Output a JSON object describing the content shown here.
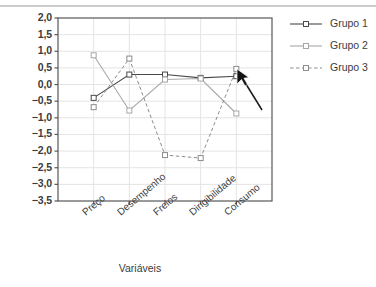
{
  "chart_data": {
    "type": "line",
    "title": "",
    "xlabel": "Variáveis",
    "ylabel": "",
    "categories": [
      "Preço",
      "Desempenho",
      "Freios",
      "Dirigibilidade",
      "Consumo"
    ],
    "series": [
      {
        "name": "Grupo 1",
        "values": [
          -0.4,
          0.3,
          0.3,
          0.2,
          0.25
        ],
        "color": "#4a4a4a",
        "dash": "solid",
        "marker": "open-square"
      },
      {
        "name": "Grupo 2",
        "values": [
          0.88,
          -0.78,
          0.15,
          0.18,
          -0.87
        ],
        "color": "#a8a8a8",
        "dash": "solid",
        "marker": "open-square"
      },
      {
        "name": "Grupo 3",
        "values": [
          -0.68,
          0.78,
          -2.12,
          -2.21,
          0.47
        ],
        "color": "#8c8c8c",
        "dash": "dashed",
        "marker": "open-square"
      }
    ],
    "ylim": [
      -3.5,
      2.0
    ],
    "yticks": [
      "2,0",
      "1,5",
      "1,0",
      "0,5",
      "0,0",
      "-0,5",
      "-1,0",
      "-1,5",
      "-2,0",
      "-2,5",
      "-3,0",
      "-3,5"
    ],
    "ytick_values": [
      2.0,
      1.5,
      1.0,
      0.5,
      0.0,
      -0.5,
      -1.0,
      -1.5,
      -2.0,
      -2.5,
      -3.0,
      -3.5
    ],
    "grid": true,
    "grid_axis": "y",
    "legend_position": "right",
    "legend_entries": [
      "Grupo 1",
      "Grupo 2",
      "Grupo 3"
    ],
    "annotations": [
      {
        "name": "mouse-cursor-arrow",
        "x": "Consumo",
        "points_to": "Grupo 1 Consumo point"
      }
    ]
  },
  "colors": {
    "grid": "#e4e4e4",
    "axis": "#585858",
    "text": "#3c3c3c",
    "series1": "#4a4a4a",
    "series2": "#a8a8a8",
    "series3": "#8c8c8c",
    "cursor": "#1a1a1a"
  }
}
